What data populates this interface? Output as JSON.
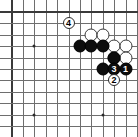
{
  "diagram": {
    "type": "go-board-diagram",
    "board": {
      "width_px": 138,
      "height_px": 137,
      "grid_spacing_px": 11.4,
      "origin_x_px": 11.5,
      "origin_y_px": 12.0,
      "cols": 12,
      "rows": 11,
      "edges": [
        "top",
        "left"
      ],
      "line_color": "#6e6e6e",
      "edge_color": "#3a3a3a",
      "background": "#ffffff"
    },
    "hoshi": [
      {
        "name": "star-point-upper-left",
        "col": 2,
        "row": 3
      },
      {
        "name": "star-point-lower-left",
        "col": 2,
        "row": 9
      },
      {
        "name": "star-point-lower-right",
        "col": 8,
        "row": 9
      }
    ],
    "stones": [
      {
        "id": "w-a",
        "color": "white",
        "col": 7,
        "row": 2,
        "label": ""
      },
      {
        "id": "w-b",
        "color": "white",
        "col": 8,
        "row": 2,
        "label": ""
      },
      {
        "id": "w-c",
        "color": "white",
        "col": 9,
        "row": 3,
        "label": ""
      },
      {
        "id": "w-d",
        "color": "white",
        "col": 10,
        "row": 3,
        "label": ""
      },
      {
        "id": "w-e",
        "color": "white",
        "col": 9,
        "row": 4,
        "label": ""
      },
      {
        "id": "w-f",
        "color": "white",
        "col": 10,
        "row": 4,
        "label": ""
      },
      {
        "id": "b-a",
        "color": "black",
        "col": 6,
        "row": 3,
        "label": ""
      },
      {
        "id": "b-b",
        "color": "black",
        "col": 7,
        "row": 3,
        "label": ""
      },
      {
        "id": "b-c",
        "color": "black",
        "col": 8,
        "row": 3,
        "label": ""
      },
      {
        "id": "b-d",
        "color": "black",
        "col": 9,
        "row": 4,
        "label": ""
      },
      {
        "id": "b-e",
        "color": "black",
        "col": 8,
        "row": 5,
        "label": ""
      },
      {
        "id": "b-1",
        "color": "black",
        "col": 10,
        "row": 5,
        "label": "1"
      },
      {
        "id": "b-3",
        "color": "black",
        "col": 9,
        "row": 5,
        "label": "3"
      }
    ],
    "markers": [
      {
        "id": "m-4",
        "label": "4",
        "col": 5,
        "row": 1,
        "color": "white"
      },
      {
        "id": "m-2",
        "label": "2",
        "col": 9,
        "row": 6,
        "color": "white"
      }
    ],
    "stone_diameter_px": 13,
    "marker_diameter_px": 12
  }
}
